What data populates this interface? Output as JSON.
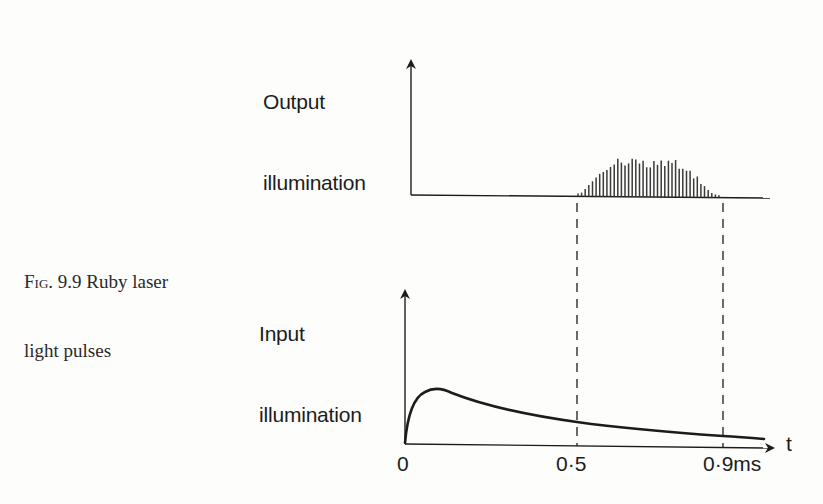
{
  "caption": {
    "fig_tag": "Fig. 9.9",
    "line1_rest": " Ruby laser",
    "line2": "light pulses"
  },
  "output_plot": {
    "ylabel_line1": "Output",
    "ylabel_line2": "illumination"
  },
  "input_plot": {
    "ylabel_line1": "Input",
    "ylabel_line2": "illumination",
    "xlabel": "t"
  },
  "x_ticks": [
    {
      "label": "0"
    },
    {
      "label": "0·5"
    },
    {
      "label": "0·9ms"
    }
  ],
  "colors": {
    "ink": "#1c1c1c",
    "paper": "#fdfdfc"
  },
  "chart_data": [
    {
      "type": "bar",
      "title": "Output illumination",
      "xlabel": "t (ms)",
      "ylabel": "Output illumination",
      "description": "Train of sharp spikes (laser relaxation oscillations) occurring between t≈0.5 ms and t≈0.9 ms, with a rounded envelope peaking near t≈0.68 ms",
      "x_range": [
        0.5,
        0.9
      ],
      "spike_relative_heights": [
        0.08,
        0.1,
        0.2,
        0.3,
        0.4,
        0.5,
        0.6,
        0.65,
        0.7,
        0.78,
        0.85,
        1.0,
        0.9,
        0.82,
        0.88,
        1.0,
        0.98,
        0.88,
        0.95,
        0.78,
        0.78,
        0.95,
        0.85,
        0.96,
        0.82,
        0.96,
        0.9,
        0.98,
        0.75,
        0.75,
        0.7,
        0.7,
        0.5,
        0.55,
        0.35,
        0.3,
        0.2,
        0.12,
        0.08,
        0.06
      ]
    },
    {
      "type": "line",
      "title": "Input illumination",
      "xlabel": "t (ms)",
      "ylabel": "Input illumination",
      "x": [
        0,
        0.02,
        0.05,
        0.1,
        0.2,
        0.3,
        0.4,
        0.5,
        0.6,
        0.7,
        0.8,
        0.9,
        1.0
      ],
      "values": [
        0,
        0.7,
        0.95,
        1.0,
        0.85,
        0.68,
        0.55,
        0.46,
        0.38,
        0.32,
        0.27,
        0.23,
        0.2
      ],
      "annotations": [
        "dashed vertical lines at t=0.5 ms and t=0.9 ms linking both plots"
      ]
    }
  ]
}
